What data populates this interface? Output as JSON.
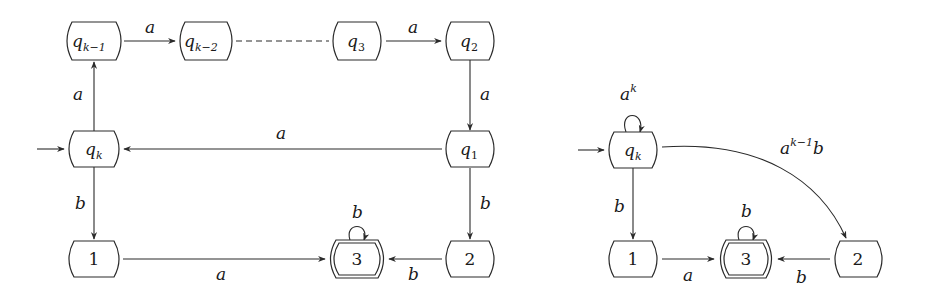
{
  "left_automaton": {
    "states": [
      {
        "id": "qk-1",
        "base": "q",
        "sub": "k−1",
        "cx": 94,
        "cy": 41
      },
      {
        "id": "qk-2",
        "base": "q",
        "sub": "k−2",
        "cx": 206,
        "cy": 41
      },
      {
        "id": "q3",
        "base": "q",
        "sub": "3",
        "cx": 357,
        "cy": 41
      },
      {
        "id": "q2",
        "base": "q",
        "sub": "2",
        "cx": 470,
        "cy": 41
      },
      {
        "id": "qk",
        "base": "q",
        "sub": "k",
        "cx": 94,
        "cy": 149,
        "initial": true
      },
      {
        "id": "q1",
        "base": "q",
        "sub": "1",
        "cx": 470,
        "cy": 149
      },
      {
        "id": "s1",
        "label": "1",
        "cx": 94,
        "cy": 259
      },
      {
        "id": "s3",
        "label": "3",
        "cx": 357,
        "cy": 259,
        "accepting": true
      },
      {
        "id": "s2",
        "label": "2",
        "cx": 470,
        "cy": 259
      }
    ],
    "labels": {
      "qk1_qk2": "a",
      "q3_q2": "a",
      "qk_qk1": "a",
      "q2_q1": "a",
      "q1_qk": "a",
      "qk_1": "b",
      "q1_2": "b",
      "s1_s3": "a",
      "s2_s3": "b",
      "s3_loop": "b"
    }
  },
  "right_automaton": {
    "states": [
      {
        "id": "qk",
        "base": "q",
        "sub": "k",
        "cx": 633,
        "cy": 150,
        "initial": true
      },
      {
        "id": "s1",
        "label": "1",
        "cx": 633,
        "cy": 259
      },
      {
        "id": "s3",
        "label": "3",
        "cx": 746,
        "cy": 259,
        "accepting": true
      },
      {
        "id": "s2",
        "label": "2",
        "cx": 858,
        "cy": 259
      }
    ],
    "labels": {
      "qk_loop_base": "a",
      "qk_loop_sup": "k",
      "qk_2_base": "a",
      "qk_2_sup": "k−1",
      "qk_2_tail": "b",
      "qk_1": "b",
      "s1_s3": "a",
      "s2_s3": "b",
      "s3_loop": "b"
    }
  }
}
